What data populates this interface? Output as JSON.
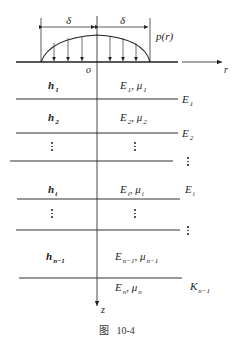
{
  "figure": {
    "caption_prefix": "图",
    "caption_number": "10-4",
    "load": {
      "label": "p(r)",
      "half_width_left": "δ",
      "half_width_right": "δ",
      "origin": "o"
    },
    "axes": {
      "horizontal": "r",
      "vertical": "z"
    },
    "layers": [
      {
        "thickness": "h",
        "thickness_sub": "1",
        "modulus": "E",
        "modulus_sub": "1",
        "poisson": "μ",
        "poisson_sub": "1",
        "interface": "E",
        "interface_sub": "1"
      },
      {
        "thickness": "h",
        "thickness_sub": "2",
        "modulus": "E",
        "modulus_sub": "2",
        "poisson": "μ",
        "poisson_sub": "2",
        "interface": "E",
        "interface_sub": "2"
      },
      {
        "thickness": "⋮",
        "modulus": "⋮",
        "interface": "⋮"
      },
      {
        "thickness": "h",
        "thickness_sub": "i",
        "modulus": "E",
        "modulus_sub": "i",
        "poisson": "μ",
        "poisson_sub": "i",
        "interface": "E",
        "interface_sub": "i"
      },
      {
        "thickness": "⋮",
        "modulus": "⋮",
        "interface": "⋮"
      },
      {
        "thickness": "h",
        "thickness_sub": "n−1",
        "modulus": "E",
        "modulus_sub": "n−1",
        "poisson": "μ",
        "poisson_sub": "n−1",
        "interface": "K",
        "interface_sub": "n−1"
      },
      {
        "modulus": "E",
        "modulus_sub": "n",
        "poisson": "μ",
        "poisson_sub": "n"
      }
    ],
    "separator": ","
  }
}
